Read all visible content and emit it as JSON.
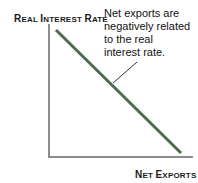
{
  "figure": {
    "background_color": "#ffffff",
    "width": 198,
    "height": 183
  },
  "axes": {
    "y_label_primary": "R",
    "y_label_primary_rest": "EAL ",
    "y_label": "REAL INTEREST RATE",
    "y_label_parts": [
      {
        "text": "R",
        "style": "cap"
      },
      {
        "text": "EAL ",
        "style": "sc"
      },
      {
        "text": "I",
        "style": "cap"
      },
      {
        "text": "NTEREST ",
        "style": "sc"
      },
      {
        "text": "R",
        "style": "cap"
      },
      {
        "text": "ATE",
        "style": "sc"
      }
    ],
    "x_label": "NET EXPORTS",
    "x_label_parts": [
      {
        "text": "N",
        "style": "cap"
      },
      {
        "text": "ET ",
        "style": "sc"
      },
      {
        "text": "E",
        "style": "cap"
      },
      {
        "text": "XPORTS",
        "style": "sc"
      }
    ],
    "axis_color": "#8d8d8d",
    "axis_width": 2
  },
  "annotation": {
    "text": "Net exports are negatively related to the real interest rate.",
    "lines": [
      "Net exports are",
      "negatively related",
      "to the real",
      "interest rate."
    ],
    "color": "#111111",
    "leader_line_color": "#2f2f2f"
  },
  "chart_data": {
    "type": "line",
    "title": "",
    "subtitle": "",
    "xlabel": "NET EXPORTS",
    "ylabel": "REAL INTEREST RATE",
    "grid": false,
    "legend": null,
    "axis_ticks": {
      "x": [],
      "y": []
    },
    "xlim": [
      0,
      1
    ],
    "ylim": [
      0,
      1
    ],
    "series": [
      {
        "name": "Net exports curve",
        "color": "#4e6b4e",
        "line_width": 3,
        "relationship": "negative",
        "x": [
          0.05,
          1.0
        ],
        "y": [
          1.0,
          0.03
        ],
        "pixel_start": {
          "x": 56,
          "y": 30
        },
        "pixel_end": {
          "x": 181,
          "y": 153
        }
      }
    ],
    "annotations": [
      {
        "text": "Net exports are negatively related to the real interest rate.",
        "points_to_series": "Net exports curve",
        "leader_from": {
          "x": 137,
          "y": 62
        },
        "leader_to": {
          "x": 113,
          "y": 83
        }
      }
    ]
  }
}
